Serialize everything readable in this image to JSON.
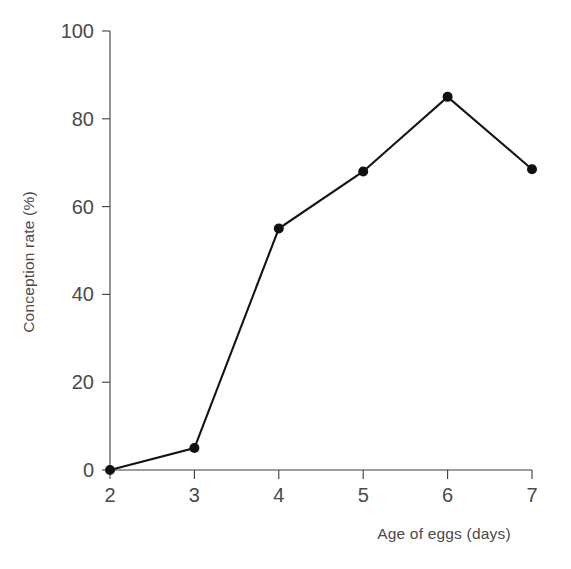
{
  "chart_data": {
    "type": "line",
    "title": "",
    "subtitle": "",
    "xlabel": "Age of eggs (days)",
    "ylabel": "Conception rate (%)",
    "x": [
      2,
      3,
      4,
      5,
      6,
      7
    ],
    "values": [
      0,
      5,
      55,
      68,
      85,
      68.5
    ],
    "series": [
      {
        "name": "Conception rate",
        "values": [
          0,
          5,
          55,
          68,
          85,
          68.5
        ],
        "color": "#101010",
        "marker": "circle",
        "marker_size": 5
      }
    ],
    "xlim": [
      2,
      7
    ],
    "ylim": [
      0,
      100
    ],
    "xticks": [
      2,
      3,
      4,
      5,
      6,
      7
    ],
    "yticks": [
      0,
      20,
      40,
      60,
      80,
      100
    ],
    "xtick_labels": [
      "2",
      "3",
      "4",
      "5",
      "6",
      "7"
    ],
    "ytick_labels": [
      "0",
      "20",
      "40",
      "60",
      "80",
      "100"
    ],
    "grid": false,
    "legend": null,
    "legend_position": "none",
    "annotations": [],
    "background_color": "#ffffff",
    "axis_color": "#3c3c3c",
    "text_color": "#4a4a4a"
  },
  "axes": {
    "y_title": "Conception rate (%)",
    "x_title": "Age of eggs (days)"
  }
}
